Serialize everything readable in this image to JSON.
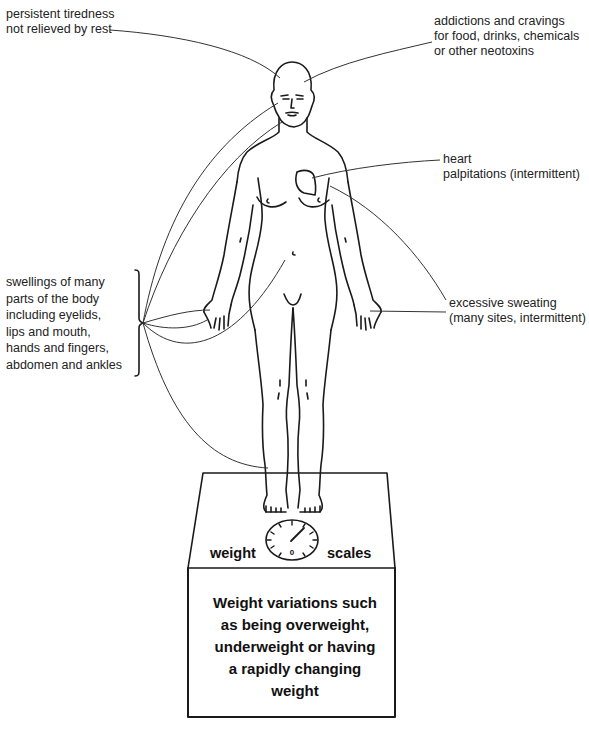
{
  "diagram": {
    "labels": {
      "tiredness": "persistent tiredness\nnot relieved by rest",
      "addictions": "addictions and cravings\nfor food, drinks, chemicals\nor other neotoxins",
      "heart": "heart\npalpitations (intermittent)",
      "swellings": "swellings of many\nparts of the body\nincluding eyelids,\nlips and  mouth,\nhands and fingers,\nabdomen and ankles",
      "sweating": "excessive sweating\n(many sites, intermittent)"
    },
    "scales": {
      "left_word": "weight",
      "right_word": "scales",
      "dial_zero": "0",
      "box_text": "Weight variations such\nas being overweight,\nunderweight or having\na rapidly changing\nweight"
    },
    "colors": {
      "ink": "#1a1a1a",
      "background": "#ffffff"
    }
  }
}
